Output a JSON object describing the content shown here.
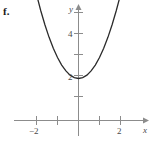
{
  "figure": {
    "part_label": "f.",
    "width": 155,
    "height": 152,
    "background_color": "#ffffff",
    "axis_color": "#8c8c8c",
    "curve_color": "#2b2b2b",
    "label_color": "#4a4a4a"
  },
  "chart_data": {
    "type": "line",
    "title": "",
    "subtitle": "",
    "xlabel": "x",
    "ylabel": "y",
    "function": "y = x^2 + 2",
    "vertex": [
      0,
      2
    ],
    "xlim": [
      -2.9,
      3.0
    ],
    "ylim": [
      -1.1,
      6.6
    ],
    "grid": false,
    "legend": null,
    "x_ticks": [
      -2,
      -1,
      1,
      2
    ],
    "x_tick_labels": [
      "−2",
      "",
      "",
      "2"
    ],
    "y_ticks": [
      1,
      2,
      3,
      4,
      5,
      6
    ],
    "y_tick_labels": [
      "",
      "2",
      "",
      "4",
      "",
      ""
    ],
    "axis_arrows": [
      "x-positive",
      "y-positive"
    ],
    "series": [
      {
        "name": "parabola",
        "x": [
          -2.05,
          -1.8,
          -1.6,
          -1.4,
          -1.2,
          -1.0,
          -0.8,
          -0.6,
          -0.4,
          -0.2,
          0.0,
          0.2,
          0.4,
          0.6,
          0.8,
          1.0,
          1.2,
          1.4,
          1.6,
          1.8,
          1.95
        ],
        "y": [
          6.2,
          5.24,
          4.56,
          3.96,
          3.44,
          3.0,
          2.64,
          2.36,
          2.16,
          2.04,
          2.0,
          2.04,
          2.16,
          2.36,
          2.64,
          3.0,
          3.44,
          3.96,
          4.56,
          5.24,
          5.8
        ]
      }
    ]
  },
  "axis_labels": {
    "x_axis_name": "x",
    "y_axis_name": "y",
    "x_neg2": "−2",
    "x_pos2": "2",
    "y_2": "2",
    "y_4": "4"
  }
}
